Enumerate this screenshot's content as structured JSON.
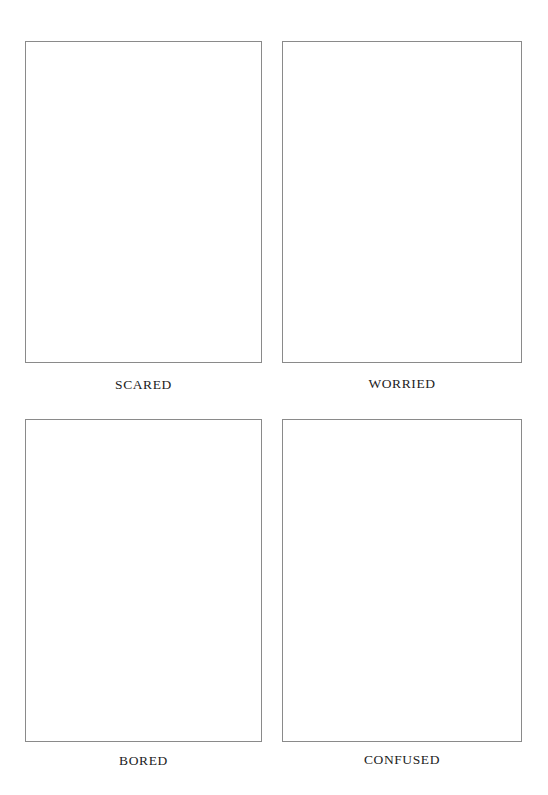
{
  "cards": [
    {
      "label": "SCARED"
    },
    {
      "label": "WORRIED"
    },
    {
      "label": "BORED"
    },
    {
      "label": "CONFUSED"
    }
  ],
  "colors": {
    "frame_border": "#8a8a8a",
    "label_text": "#222222",
    "background": "#ffffff"
  }
}
